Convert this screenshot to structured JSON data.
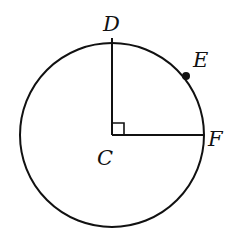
{
  "diagram": {
    "type": "circle-geometry",
    "circle": {
      "center_label": "C",
      "cx": 112,
      "cy": 135,
      "r": 92
    },
    "points": [
      {
        "label": "D",
        "x": 112,
        "y": 38,
        "label_x": 103,
        "label_y": 31
      },
      {
        "label": "E",
        "x": 186,
        "y": 76,
        "label_x": 193,
        "label_y": 67
      },
      {
        "label": "F",
        "x": 204,
        "y": 135,
        "label_x": 208,
        "label_y": 146
      },
      {
        "label": "C",
        "x": 112,
        "y": 135,
        "label_x": 97,
        "label_y": 165
      }
    ],
    "segments": [
      "CD",
      "CF"
    ],
    "right_angle_at": "C",
    "stroke_color": "#111111"
  }
}
